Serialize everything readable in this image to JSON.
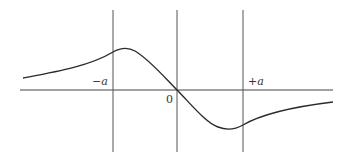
{
  "diagram": {
    "labels": {
      "left_marker": "−a",
      "origin": "0",
      "right_marker": "+a"
    },
    "colors": {
      "line": "#444444",
      "curve": "#2a2a2a",
      "background": "#ffffff"
    }
  }
}
